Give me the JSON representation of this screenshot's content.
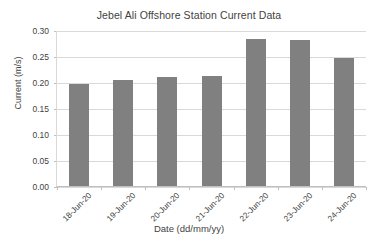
{
  "chart_data": {
    "type": "bar",
    "title": "Jebel Ali Offshore Station Current Data",
    "xlabel": "Date (dd/mm/yy)",
    "ylabel": "Current (m/s)",
    "categories": [
      "18-Jun-20",
      "19-Jun-20",
      "20-Jun-20",
      "21-Jun-20",
      "22-Jun-20",
      "23-Jun-20",
      "24-Jun-20"
    ],
    "values": [
      0.197,
      0.204,
      0.21,
      0.212,
      0.283,
      0.281,
      0.246
    ],
    "ylim": [
      0.0,
      0.3
    ],
    "ytick_labels": [
      "0.00",
      "0.05",
      "0.10",
      "0.15",
      "0.20",
      "0.25",
      "0.30"
    ],
    "ytick_values": [
      0.0,
      0.05,
      0.1,
      0.15,
      0.2,
      0.25,
      0.3
    ],
    "grid": true,
    "legend": "none",
    "bar_color": "#808080",
    "gridline_color": "#d9d9d9",
    "axis_color": "#bfbfbf",
    "text_color": "#3f3f3f",
    "background": "#ffffff"
  }
}
